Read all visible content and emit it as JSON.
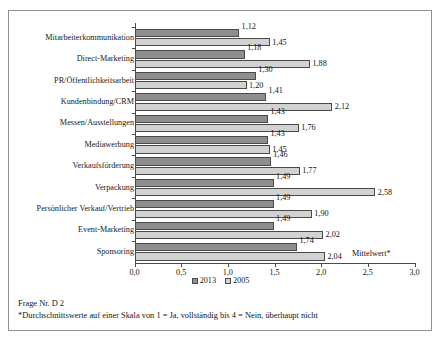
{
  "chart_data": {
    "type": "bar",
    "orientation": "horizontal",
    "title": "",
    "xlabel": "Mittelwert*",
    "ylabel": "",
    "xlim": [
      0.0,
      3.0
    ],
    "xticks": [
      "0,0",
      "0,5",
      "1,0",
      "1,5",
      "2,0",
      "2,5",
      "3,0"
    ],
    "xtick_values": [
      0.0,
      0.5,
      1.0,
      1.5,
      2.0,
      2.5,
      3.0
    ],
    "grid": false,
    "legend_position": "bottom-center",
    "categories": [
      "Mitarbeiterkommunikation",
      "Direct-Marketing",
      "PR/Öffentlichkeitsarbeit",
      "Kundenbindung/CRM",
      "Messen/Ausstellungen",
      "Mediawerbung",
      "Verkaufsförderung",
      "Verpackung",
      "Persönlicher Verkauf/Vertrieb",
      "Event-Marketing",
      "Sponsoring"
    ],
    "series": [
      {
        "name": "2013",
        "color": "#8e8e8e",
        "values": [
          1.12,
          1.18,
          1.3,
          1.41,
          1.43,
          1.43,
          1.46,
          1.49,
          1.49,
          1.49,
          1.74
        ],
        "labels": [
          "1,12",
          "1,18",
          "1,30",
          "1,41",
          "1,43",
          "1,43",
          "1,46",
          "1,49",
          "1,49",
          "1,49",
          "1,74"
        ]
      },
      {
        "name": "2005",
        "color": "#d2d2d2",
        "values": [
          1.45,
          1.88,
          1.2,
          2.12,
          1.76,
          1.45,
          1.77,
          2.58,
          1.9,
          2.02,
          2.04
        ],
        "labels": [
          "1,45",
          "1,88",
          "1,20",
          "2,12",
          "1,76",
          "1,45",
          "1,77",
          "2,58",
          "1,90",
          "2,02",
          "2,04"
        ]
      }
    ]
  },
  "legend": {
    "items": [
      {
        "label": "2013"
      },
      {
        "label": "2005"
      }
    ]
  },
  "notes": {
    "question": "Frage Nr. D 2",
    "footnote": "*Durchschnittswerte auf einer Skala von 1 = Ja, vollständig bis 4 = Nein, überhaupt nicht"
  }
}
